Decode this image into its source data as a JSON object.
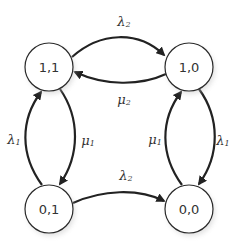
{
  "diagram": {
    "type": "state-transition",
    "nodes": [
      {
        "id": "n11",
        "label": "1,1",
        "cx": 49,
        "cy": 67
      },
      {
        "id": "n10",
        "label": "1,0",
        "cx": 189,
        "cy": 67
      },
      {
        "id": "n01",
        "label": "0,1",
        "cx": 49,
        "cy": 209
      },
      {
        "id": "n00",
        "label": "0,0",
        "cx": 189,
        "cy": 209
      }
    ],
    "edges": [
      {
        "from": "1,1",
        "to": "1,0",
        "symbol": "λ",
        "sub": "2"
      },
      {
        "from": "1,0",
        "to": "1,1",
        "symbol": "μ",
        "sub": "2"
      },
      {
        "from": "0,1",
        "to": "1,1",
        "symbol": "λ",
        "sub": "1"
      },
      {
        "from": "1,1",
        "to": "0,1",
        "symbol": "μ",
        "sub": "1"
      },
      {
        "from": "0,1",
        "to": "0,0",
        "symbol": "λ",
        "sub": "2"
      },
      {
        "from": "0,0",
        "to": "1,0",
        "symbol": "μ",
        "sub": "1"
      },
      {
        "from": "1,0",
        "to": "0,0",
        "symbol": "λ",
        "sub": "1"
      }
    ]
  },
  "labels": {
    "n11": "1,1",
    "n10": "1,0",
    "n01": "0,1",
    "n00": "0,0",
    "lambda": "λ",
    "mu": "μ",
    "sub1": "1",
    "sub2": "2"
  }
}
